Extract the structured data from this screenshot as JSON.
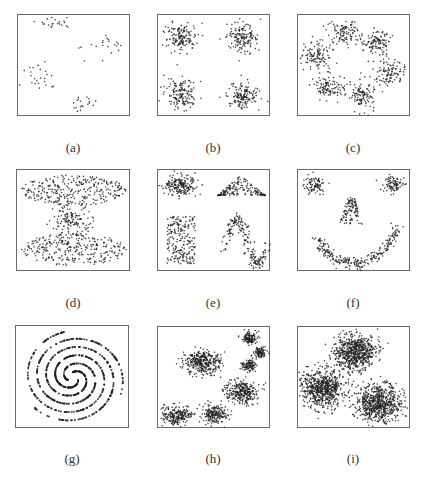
{
  "figure": {
    "panels": [
      {
        "id": "a",
        "label": "(a)"
      },
      {
        "id": "b",
        "label": "(b)"
      },
      {
        "id": "c",
        "label": "(c)"
      },
      {
        "id": "d",
        "label": "(d)"
      },
      {
        "id": "e",
        "label": "(e)"
      },
      {
        "id": "f",
        "label": "(f)"
      },
      {
        "id": "g",
        "label": "(g)"
      },
      {
        "id": "h",
        "label": "(h)"
      },
      {
        "id": "i",
        "label": "(i)"
      }
    ],
    "colors": {
      "point": "#222222",
      "frame": "#6b6b6b",
      "label": "#333333"
    }
  },
  "chart_data": [
    {
      "id": "a",
      "type": "scatter",
      "title": "(a)",
      "xlabel": "",
      "ylabel": "",
      "grid": false,
      "description": "5 sparse small clusters",
      "clusters": [
        {
          "cx": 0.33,
          "cy": 0.08,
          "sx": 0.09,
          "sy": 0.03,
          "n": 22
        },
        {
          "cx": 0.85,
          "cy": 0.27,
          "sx": 0.06,
          "sy": 0.05,
          "n": 14
        },
        {
          "cx": 0.66,
          "cy": 0.33,
          "sx": 0.06,
          "sy": 0.08,
          "n": 7
        },
        {
          "cx": 0.18,
          "cy": 0.6,
          "sx": 0.08,
          "sy": 0.07,
          "n": 24
        },
        {
          "cx": 0.56,
          "cy": 0.87,
          "sx": 0.06,
          "sy": 0.05,
          "n": 20
        }
      ]
    },
    {
      "id": "b",
      "type": "scatter",
      "title": "(b)",
      "xlabel": "",
      "ylabel": "",
      "grid": false,
      "description": "4 Gaussian clusters in square arrangement",
      "clusters": [
        {
          "cx": 0.2,
          "cy": 0.22,
          "sx": 0.07,
          "sy": 0.07,
          "n": 150
        },
        {
          "cx": 0.75,
          "cy": 0.22,
          "sx": 0.07,
          "sy": 0.07,
          "n": 150
        },
        {
          "cx": 0.21,
          "cy": 0.77,
          "sx": 0.07,
          "sy": 0.07,
          "n": 150
        },
        {
          "cx": 0.75,
          "cy": 0.79,
          "sx": 0.07,
          "sy": 0.07,
          "n": 150
        }
      ]
    },
    {
      "id": "c",
      "type": "scatter",
      "title": "(c)",
      "xlabel": "",
      "ylabel": "",
      "grid": false,
      "description": "6 Gaussian clusters arranged in a ring",
      "clusters": [
        {
          "cx": 0.4,
          "cy": 0.18,
          "sx": 0.07,
          "sy": 0.06,
          "n": 110
        },
        {
          "cx": 0.7,
          "cy": 0.26,
          "sx": 0.06,
          "sy": 0.06,
          "n": 110
        },
        {
          "cx": 0.16,
          "cy": 0.4,
          "sx": 0.07,
          "sy": 0.06,
          "n": 110
        },
        {
          "cx": 0.82,
          "cy": 0.56,
          "sx": 0.07,
          "sy": 0.06,
          "n": 110
        },
        {
          "cx": 0.27,
          "cy": 0.7,
          "sx": 0.07,
          "sy": 0.06,
          "n": 110
        },
        {
          "cx": 0.57,
          "cy": 0.78,
          "sx": 0.06,
          "sy": 0.07,
          "n": 110
        }
      ]
    },
    {
      "id": "d",
      "type": "scatter",
      "title": "(d)",
      "xlabel": "",
      "ylabel": "",
      "grid": false,
      "description": "Two wide uniform bands with a dense center blob",
      "shapes": [
        {
          "kind": "ellipse_band",
          "cx": 0.5,
          "cy": 0.2,
          "rx": 0.46,
          "ry": 0.15,
          "n": 300
        },
        {
          "kind": "gauss",
          "cx": 0.48,
          "cy": 0.48,
          "sx": 0.09,
          "sy": 0.07,
          "n": 130
        },
        {
          "kind": "ellipse_band",
          "cx": 0.5,
          "cy": 0.78,
          "rx": 0.46,
          "ry": 0.16,
          "n": 300
        }
      ]
    },
    {
      "id": "e",
      "type": "scatter",
      "title": "(e)",
      "xlabel": "",
      "ylabel": "",
      "grid": false,
      "description": "Gaussian blob, triangle, uniform rectangle, sine curve",
      "shapes": [
        {
          "kind": "gauss",
          "cx": 0.2,
          "cy": 0.15,
          "sx": 0.07,
          "sy": 0.05,
          "n": 200
        },
        {
          "kind": "triangle",
          "x0": 0.53,
          "x1": 0.95,
          "apex": 0.73,
          "top": 0.05,
          "base": 0.25,
          "n": 180
        },
        {
          "kind": "rect",
          "x0": 0.08,
          "x1": 0.33,
          "y0": 0.45,
          "y1": 0.92,
          "n": 220
        },
        {
          "kind": "sine",
          "x0": 0.58,
          "x1": 0.98,
          "cy": 0.7,
          "amp": 0.22,
          "thick": 0.025,
          "n": 200
        }
      ]
    },
    {
      "id": "f",
      "type": "scatter",
      "title": "(f)",
      "xlabel": "",
      "ylabel": "",
      "grid": false,
      "description": "Smiley face: two eye clusters, nose, smile arc",
      "shapes": [
        {
          "kind": "gauss",
          "cx": 0.15,
          "cy": 0.14,
          "sx": 0.05,
          "sy": 0.04,
          "n": 90
        },
        {
          "kind": "gauss",
          "cx": 0.85,
          "cy": 0.14,
          "sx": 0.05,
          "sy": 0.04,
          "n": 90
        },
        {
          "kind": "nose",
          "cx": 0.47,
          "top": 0.27,
          "bottom": 0.53,
          "n": 110
        },
        {
          "kind": "smile",
          "cx": 0.5,
          "cy": 0.2,
          "rx": 0.44,
          "ry": 0.72,
          "t0": 0.22,
          "t1": 0.84,
          "thick": 0.025,
          "n": 260
        }
      ]
    },
    {
      "id": "g",
      "type": "scatter",
      "title": "(g)",
      "xlabel": "",
      "ylabel": "",
      "grid": false,
      "description": "Three interleaved spirals",
      "shapes": [
        {
          "kind": "spiral",
          "cx": 0.5,
          "cy": 0.5,
          "phase": 0.0,
          "n": 260
        },
        {
          "kind": "spiral",
          "cx": 0.5,
          "cy": 0.5,
          "phase": 2.094,
          "n": 260
        },
        {
          "kind": "spiral",
          "cx": 0.5,
          "cy": 0.5,
          "phase": 4.189,
          "n": 260
        }
      ]
    },
    {
      "id": "h",
      "type": "scatter",
      "title": "(h)",
      "xlabel": "",
      "ylabel": "",
      "grid": false,
      "description": "7 dense Gaussian clusters of varying size",
      "clusters": [
        {
          "cx": 0.81,
          "cy": 0.11,
          "sx": 0.035,
          "sy": 0.03,
          "n": 120
        },
        {
          "cx": 0.9,
          "cy": 0.25,
          "sx": 0.03,
          "sy": 0.025,
          "n": 100
        },
        {
          "cx": 0.8,
          "cy": 0.38,
          "sx": 0.03,
          "sy": 0.025,
          "n": 100
        },
        {
          "cx": 0.4,
          "cy": 0.35,
          "sx": 0.08,
          "sy": 0.06,
          "n": 350
        },
        {
          "cx": 0.74,
          "cy": 0.63,
          "sx": 0.07,
          "sy": 0.06,
          "n": 300
        },
        {
          "cx": 0.17,
          "cy": 0.87,
          "sx": 0.07,
          "sy": 0.05,
          "n": 220
        },
        {
          "cx": 0.5,
          "cy": 0.86,
          "sx": 0.055,
          "sy": 0.045,
          "n": 200
        }
      ]
    },
    {
      "id": "i",
      "type": "scatter",
      "title": "(i)",
      "xlabel": "",
      "ylabel": "",
      "grid": false,
      "description": "3 large overlapping Gaussian clusters",
      "clusters": [
        {
          "cx": 0.5,
          "cy": 0.25,
          "sx": 0.09,
          "sy": 0.09,
          "n": 700
        },
        {
          "cx": 0.22,
          "cy": 0.6,
          "sx": 0.1,
          "sy": 0.09,
          "n": 700
        },
        {
          "cx": 0.71,
          "cy": 0.75,
          "sx": 0.1,
          "sy": 0.09,
          "n": 700
        }
      ]
    }
  ]
}
